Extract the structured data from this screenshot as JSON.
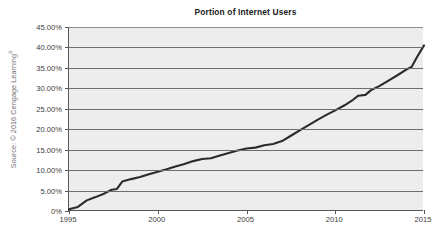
{
  "chart_title": "Portion of Internet Users",
  "source_credit": "Source: © 2016 Cengage Learning",
  "source_credit_mark": "®",
  "axes": {
    "y_tick_labels": [
      "45.00%",
      "40.00%",
      "35.00%",
      "30.00%",
      "25.00%",
      "20.00%",
      "15.00%",
      "10.00%",
      "5.00%",
      "0%"
    ],
    "x_tick_labels": [
      "1995",
      "2000",
      "2005",
      "2010",
      "2015"
    ]
  },
  "colors": {
    "plot_background": "#ededed",
    "gridline": "#6e6e70",
    "axis": "#58585a",
    "data_line": "#2b2b2b",
    "page_background": "#ffffff",
    "text": "#3b3b3b",
    "title_text": "#1a1a1a",
    "source_text": "#6f6f6f"
  },
  "chart_data": {
    "type": "line",
    "title": "Portion of Internet Users",
    "xlabel": "",
    "ylabel": "",
    "xlim": [
      1995,
      2015
    ],
    "ylim": [
      0,
      45
    ],
    "y_unit": "percent",
    "grid": true,
    "legend": false,
    "series": [
      {
        "name": "Portion of Internet Users",
        "x": [
          1995,
          1995.5,
          1996,
          1996.5,
          1997,
          1997.4,
          1997.7,
          1998,
          1998.5,
          1999,
          1999.5,
          2000,
          2000.5,
          2001,
          2001.5,
          2002,
          2002.5,
          2003,
          2003.5,
          2004,
          2004.5,
          2005,
          2005.5,
          2006,
          2006.5,
          2007,
          2007.5,
          2008,
          2008.5,
          2009,
          2009.5,
          2010,
          2010.5,
          2011,
          2011.3,
          2011.7,
          2012,
          2012.5,
          2013,
          2013.5,
          2014,
          2014.3,
          2014.6,
          2015
        ],
        "values": [
          0.4,
          1.0,
          2.6,
          3.4,
          4.3,
          5.2,
          5.4,
          7.2,
          7.8,
          8.3,
          9.0,
          9.6,
          10.2,
          10.9,
          11.5,
          12.2,
          12.7,
          12.9,
          13.6,
          14.2,
          14.8,
          15.3,
          15.5,
          16.1,
          16.4,
          17.1,
          18.4,
          19.7,
          21.0,
          22.3,
          23.5,
          24.6,
          25.8,
          27.2,
          28.2,
          28.4,
          29.5,
          30.6,
          31.9,
          33.2,
          34.6,
          35.2,
          37.6,
          40.5
        ]
      }
    ]
  }
}
